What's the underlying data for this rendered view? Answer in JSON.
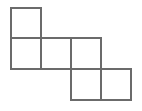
{
  "canvas": {
    "width": 142,
    "height": 111,
    "background_color": "#ffffff"
  },
  "figure": {
    "name": "polyomino-staircase",
    "square_count": 5,
    "grid": {
      "origin_x": 11,
      "origin_y": 8,
      "cell_size": 30,
      "columns": 4,
      "rows": 3
    },
    "stroke": {
      "color": "#6b6b6b",
      "width": 2,
      "linejoin": "miter"
    },
    "fill_color": "#ffffff",
    "cells": [
      {
        "name": "square-r0c0",
        "row": 0,
        "col": 0,
        "x": 11,
        "y": 8,
        "size": 30
      },
      {
        "name": "square-r1c0",
        "row": 1,
        "col": 0,
        "x": 11,
        "y": 38,
        "size": 30
      },
      {
        "name": "square-r1c1",
        "row": 1,
        "col": 1,
        "x": 41,
        "y": 38,
        "size": 30
      },
      {
        "name": "square-r1c2",
        "row": 1,
        "col": 2,
        "x": 71,
        "y": 38,
        "size": 30
      },
      {
        "name": "square-r2c2",
        "row": 2,
        "col": 2,
        "x": 71,
        "y": 69,
        "size": 30
      },
      {
        "name": "square-r2c3",
        "row": 2,
        "col": 3,
        "x": 101,
        "y": 69,
        "size": 30
      }
    ],
    "segments": [
      {
        "name": "edge-top-r0c0",
        "x1": 11,
        "y1": 8,
        "x2": 41,
        "y2": 8
      },
      {
        "name": "edge-left-col0",
        "x1": 11,
        "y1": 8,
        "x2": 11,
        "y2": 69
      },
      {
        "name": "edge-vertical-x41",
        "x1": 41,
        "y1": 8,
        "x2": 41,
        "y2": 69
      },
      {
        "name": "edge-horizontal-y38",
        "x1": 11,
        "y1": 38,
        "x2": 101,
        "y2": 38
      },
      {
        "name": "edge-horizontal-y69",
        "x1": 11,
        "y1": 69,
        "x2": 131,
        "y2": 69
      },
      {
        "name": "edge-vertical-x71",
        "x1": 71,
        "y1": 38,
        "x2": 71,
        "y2": 100
      },
      {
        "name": "edge-vertical-x101",
        "x1": 101,
        "y1": 38,
        "x2": 101,
        "y2": 100
      },
      {
        "name": "edge-vertical-x131",
        "x1": 131,
        "y1": 69,
        "x2": 131,
        "y2": 100
      },
      {
        "name": "edge-bottom-y100",
        "x1": 71,
        "y1": 100,
        "x2": 131,
        "y2": 100
      }
    ]
  }
}
